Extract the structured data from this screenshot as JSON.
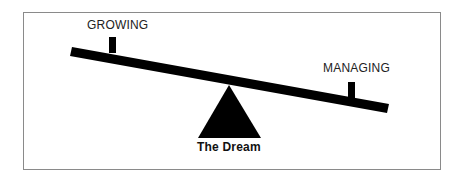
{
  "diagram": {
    "type": "seesaw",
    "labels": {
      "left": "GROWING",
      "right": "MANAGING",
      "fulcrum": "The Dream"
    },
    "colors": {
      "ink": "#000000",
      "frame": "#8a8a8a",
      "background": "#ffffff"
    }
  }
}
